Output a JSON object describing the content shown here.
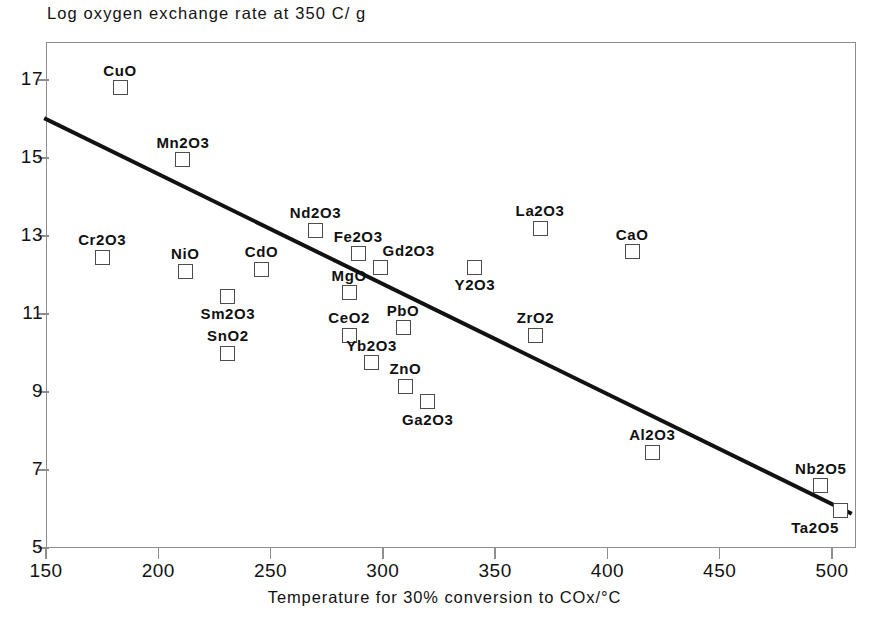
{
  "chart_data": {
    "type": "scatter",
    "title": "Log oxygen exchange rate at 350 C/ g",
    "xlabel": "Temperature for 30% conversion to COx/°C",
    "ylabel": "",
    "xlim": [
      150,
      510
    ],
    "ylim": [
      5,
      17.95
    ],
    "grid": false,
    "legend": "none",
    "xticks": [
      150,
      200,
      250,
      300,
      350,
      400,
      450,
      500
    ],
    "yticks": [
      5,
      7,
      9,
      11,
      13,
      15,
      17
    ],
    "points": [
      {
        "label": "CuO",
        "x": 183,
        "y": 16.8,
        "label_pos": "top"
      },
      {
        "label": "Mn2O3",
        "x": 211,
        "y": 14.95,
        "label_pos": "top"
      },
      {
        "label": "Cr2O3",
        "x": 175,
        "y": 12.45,
        "label_pos": "top"
      },
      {
        "label": "NiO",
        "x": 212,
        "y": 12.1,
        "label_pos": "top"
      },
      {
        "label": "Sm2O3",
        "x": 231,
        "y": 11.45,
        "label_pos": "bottom"
      },
      {
        "label": "SnO2",
        "x": 231,
        "y": 10.0,
        "label_pos": "top"
      },
      {
        "label": "CdO",
        "x": 246,
        "y": 12.15,
        "label_pos": "top"
      },
      {
        "label": "Nd2O3",
        "x": 270,
        "y": 13.15,
        "label_pos": "top"
      },
      {
        "label": "Fe2O3",
        "x": 289,
        "y": 12.55,
        "label_pos": "top"
      },
      {
        "label": "Gd2O3",
        "x": 299,
        "y": 12.2,
        "label_pos": "topright"
      },
      {
        "label": "MgO",
        "x": 285,
        "y": 11.55,
        "label_pos": "top"
      },
      {
        "label": "CeO2",
        "x": 285,
        "y": 10.45,
        "label_pos": "top"
      },
      {
        "label": "PbO",
        "x": 309,
        "y": 10.65,
        "label_pos": "top"
      },
      {
        "label": "Yb2O3",
        "x": 295,
        "y": 9.75,
        "label_pos": "top"
      },
      {
        "label": "ZnO",
        "x": 310,
        "y": 9.15,
        "label_pos": "top"
      },
      {
        "label": "Ga2O3",
        "x": 320,
        "y": 8.75,
        "label_pos": "bottom"
      },
      {
        "label": "Y2O3",
        "x": 341,
        "y": 12.2,
        "label_pos": "bottom"
      },
      {
        "label": "La2O3",
        "x": 370,
        "y": 13.2,
        "label_pos": "top"
      },
      {
        "label": "ZrO2",
        "x": 368,
        "y": 10.45,
        "label_pos": "top"
      },
      {
        "label": "CaO",
        "x": 411,
        "y": 12.6,
        "label_pos": "top"
      },
      {
        "label": "Al2O3",
        "x": 420,
        "y": 7.45,
        "label_pos": "top"
      },
      {
        "label": "Nb2O5",
        "x": 495,
        "y": 6.6,
        "label_pos": "top"
      },
      {
        "label": "Ta2O5",
        "x": 504,
        "y": 5.95,
        "label_pos": "botleft"
      }
    ],
    "trendline": {
      "x1": 150,
      "y1": 16.0,
      "x2": 508,
      "y2": 5.9,
      "color": "#121212",
      "width": 4
    }
  },
  "colors": {
    "axis": "#8d8d8d",
    "text": "#121212",
    "marker_stroke": "#4c4c4c",
    "trend": "#121212"
  }
}
